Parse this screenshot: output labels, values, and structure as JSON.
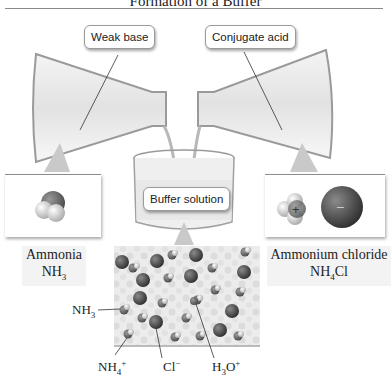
{
  "title": "Formation of a Buffer",
  "callouts": {
    "weak_base": "Weak base",
    "conjugate_acid": "Conjugate acid",
    "buffer_solution": "Buffer solution"
  },
  "left_panel": {
    "name": "Ammonia",
    "formula_main": "NH",
    "formula_sub": "3"
  },
  "right_panel": {
    "name": "Ammonium chloride",
    "formula_main": "NH",
    "formula_sub": "4",
    "formula_tail": "Cl",
    "cation_sign": "+",
    "anion_sign": "−"
  },
  "species_labels": {
    "nh3_main": "NH",
    "nh3_sub": "3",
    "nh4_main": "NH",
    "nh4_sub": "4",
    "nh4_sup": "+",
    "cl_main": "Cl",
    "cl_sup": "−",
    "h3o_main": "H",
    "h3o_sub": "3",
    "h3o_mid": "O",
    "h3o_sup": "+"
  },
  "colors": {
    "chloride": "#3f3f3f",
    "nitrogen": "#6a6a6a",
    "hydrogen": "#e8e8e8",
    "solution_bg": "#ececec"
  }
}
